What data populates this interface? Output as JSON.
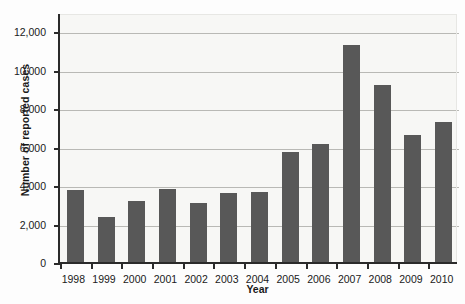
{
  "chart_data": {
    "type": "bar",
    "title": "",
    "xlabel": "Year",
    "ylabel": "Number of reported cases",
    "categories": [
      "1998",
      "1999",
      "2000",
      "2001",
      "2002",
      "2003",
      "2004",
      "2005",
      "2006",
      "2007",
      "2008",
      "2009",
      "2010"
    ],
    "values": [
      3750,
      2350,
      3150,
      3800,
      3050,
      3600,
      3650,
      5700,
      6150,
      11300,
      9200,
      6600,
      7300
    ],
    "ylim": [
      0,
      13000
    ],
    "yticks": [
      0,
      2000,
      4000,
      6000,
      8000,
      10000,
      12000
    ],
    "ytick_labels": [
      "0",
      "2,000",
      "4,000",
      "6,000",
      "8,000",
      "10,000",
      "12,000"
    ],
    "grid": "horizontal",
    "legend": "none",
    "bar_color": "#585858",
    "plot_background": "#f7f7f5",
    "axis_color": "#2b2b2b",
    "gridline_color": "#b9b9b5"
  }
}
